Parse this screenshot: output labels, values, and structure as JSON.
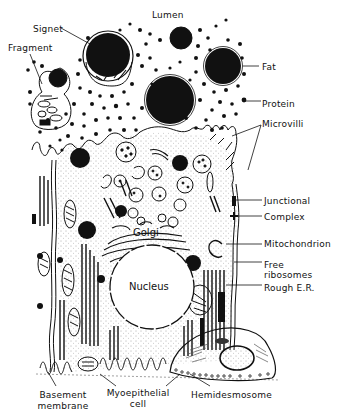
{
  "diagram": {
    "type": "cell-ultrastructure",
    "ink_color": "#111111",
    "background": "#ffffff"
  },
  "labels": {
    "lumen": "Lumen",
    "signet": "Signet",
    "fragment": "Fragment",
    "fat": "Fat",
    "protein": "Protein",
    "microvilli": "Microvilli",
    "junctional": "Junctional",
    "complex": "Complex",
    "mitochondrion": "Mitochondrion",
    "free_ribosomes_1": "Free",
    "free_ribosomes_2": "ribosomes",
    "rough_er": "Rough E.R.",
    "golgi": "Golgi",
    "nucleus": "Nucleus",
    "basement_1": "Basement",
    "basement_2": "membrane",
    "myoepithelial_1": "Myoepithelial",
    "myoepithelial_2": "cell",
    "hemidesmosome": "Hemidesmosome"
  }
}
